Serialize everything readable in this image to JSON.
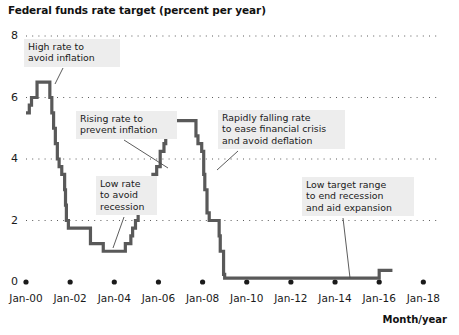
{
  "chart_data": {
    "type": "line",
    "title": "Federal funds rate target (percent per year)",
    "xlabel": "Month/year",
    "ylabel": "",
    "ylim": [
      0,
      8
    ],
    "xlim": [
      2000.0,
      2018.8
    ],
    "grid": "horizontal-dotted",
    "legend": "none",
    "yticks": [
      "0",
      "2",
      "4",
      "6",
      "8"
    ],
    "ytick_values": [
      0,
      2,
      4,
      6,
      8
    ],
    "xticks": [
      "Jan-00",
      "Jan-02",
      "Jan-04",
      "Jan-06",
      "Jan-08",
      "Jan-10",
      "Jan-12",
      "Jan-14",
      "Jan-16",
      "Jan-18"
    ],
    "xtick_values": [
      2000,
      2002,
      2004,
      2006,
      2008,
      2010,
      2012,
      2014,
      2016,
      2018
    ],
    "series": [
      {
        "name": "Federal funds rate target",
        "color": "#595959",
        "style": "step",
        "x": [
          2000.0,
          2000.15,
          2000.25,
          2000.38,
          2000.5,
          2001.0,
          2001.08,
          2001.17,
          2001.25,
          2001.33,
          2001.42,
          2001.5,
          2001.62,
          2001.75,
          2001.79,
          2001.83,
          2001.92,
          2002.0,
          2002.92,
          2003.0,
          2003.5,
          2004.0,
          2004.5,
          2004.58,
          2004.75,
          2004.83,
          2004.96,
          2005.08,
          2005.25,
          2005.33,
          2005.5,
          2005.58,
          2005.75,
          2005.92,
          2006.08,
          2006.25,
          2006.33,
          2006.5,
          2007.0,
          2007.7,
          2007.79,
          2007.96,
          2008.05,
          2008.1,
          2008.2,
          2008.3,
          2008.75,
          2008.8,
          2008.95,
          2009.0,
          2015.0,
          2015.95,
          2016.0,
          2016.6
        ],
        "y": [
          5.5,
          5.75,
          6.0,
          6.0,
          6.5,
          6.5,
          6.0,
          5.5,
          5.0,
          4.5,
          4.0,
          3.75,
          3.5,
          3.0,
          2.5,
          2.0,
          1.75,
          1.75,
          1.25,
          1.25,
          1.0,
          1.0,
          1.25,
          1.25,
          1.5,
          1.75,
          2.0,
          2.25,
          2.5,
          2.5,
          2.75,
          3.0,
          3.5,
          3.75,
          4.25,
          4.5,
          4.75,
          5.25,
          5.25,
          4.75,
          4.5,
          4.25,
          3.5,
          3.0,
          2.25,
          2.0,
          1.5,
          1.0,
          0.25,
          0.125,
          0.125,
          0.125,
          0.375,
          0.375
        ],
        "description": "Stepwise federal funds rate target from Jan-00 to 2016; peak 6.5 in 2000, trough 1.0 in 2003-2004, second peak 5.25 in 2006-2007, near-zero 0.125 from 2009 to 2015, rising to 0.375 after Dec-2015"
      }
    ],
    "annotations": [
      {
        "id": "high-rate",
        "text": "High rate to\navoid inflation",
        "box": {
          "left": 24,
          "top": 39,
          "width": 88
        },
        "leader": {
          "x1": 63,
          "y1": 68,
          "x2": 55,
          "y2": 84
        }
      },
      {
        "id": "rising-rate",
        "text": "Rising rate to\nprevent inflation",
        "box": {
          "left": 76,
          "top": 111,
          "width": 93
        },
        "leader": {
          "x1": 124,
          "y1": 140,
          "x2": 168,
          "y2": 168
        }
      },
      {
        "id": "low-rate",
        "text": "Low rate\nto avoid\nrecession",
        "box": {
          "left": 96,
          "top": 176,
          "width": 53
        },
        "leader": {
          "x1": 124,
          "y1": 217,
          "x2": 113,
          "y2": 248
        }
      },
      {
        "id": "rapidly-falling",
        "text": "Rapidly falling rate\nto ease financial crisis\nand avoid deflation",
        "box": {
          "left": 218,
          "top": 110,
          "width": 119
        },
        "leader": {
          "x1": 238,
          "y1": 151,
          "x2": 217,
          "y2": 170
        }
      },
      {
        "id": "low-target-range",
        "text": "Low target range\nto end recession\nand aid expansion",
        "box": {
          "left": 302,
          "top": 177,
          "width": 104
        },
        "leader": {
          "x1": 343,
          "y1": 218,
          "x2": 350,
          "y2": 278
        }
      }
    ]
  },
  "colors": {
    "line": "#595959",
    "grid": "#5a5a5a",
    "annotation_background": "#ededed",
    "text": "#1a1a1a",
    "marker": "#1a1a1a"
  }
}
